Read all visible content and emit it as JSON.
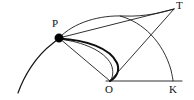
{
  "figure": {
    "background_color": "#ffffff",
    "stroke_color": "#111111",
    "width": 194,
    "height": 100
  },
  "labels": {
    "p": "P",
    "t": "T",
    "o": "O",
    "k": "K"
  },
  "points": {
    "P": {
      "x": 59,
      "y": 38,
      "marked": "true"
    },
    "T": {
      "x": 174,
      "y": 9,
      "marked": "false"
    },
    "O": {
      "x": 110,
      "y": 81,
      "marked": "false"
    },
    "K": {
      "x": 173,
      "y": 81,
      "marked": "false"
    }
  },
  "elements": {
    "baseline_O_K": "segment from O to K",
    "line_P_O": "segment from P to O",
    "line_P_T": "segment from P to T",
    "line_O_T": "segment from O to T",
    "arc_big_circle": "circular arc centred near O passing through P down to lower left",
    "arc_P_to_T_upper": "upper arc from P rising and meeting T",
    "arc_P_to_O_thick": "thick curve from P bulging right descending to O",
    "arc_T_to_K": "arc from upper region descending to K",
    "crossing_point": "arc P-K crosses segment O-T near (148, 25)"
  }
}
